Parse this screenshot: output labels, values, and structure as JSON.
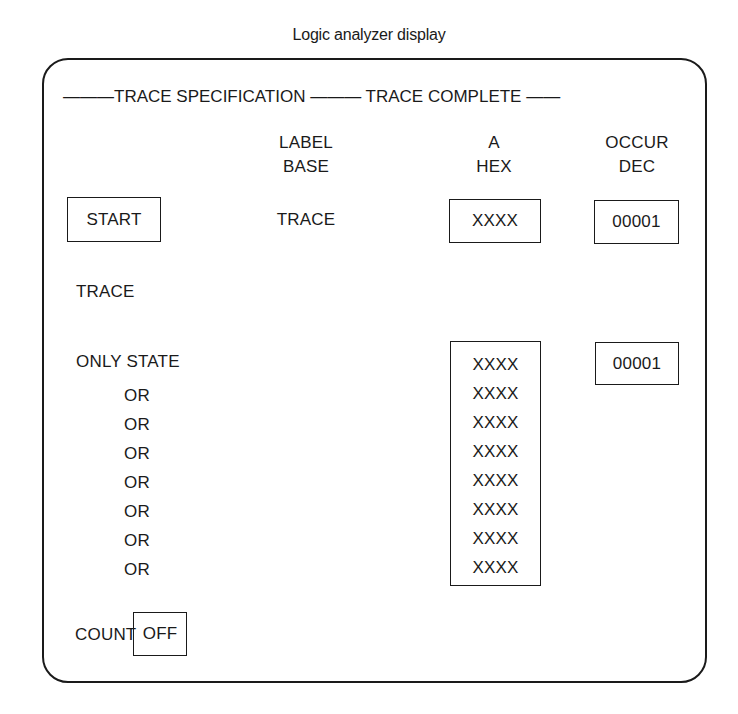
{
  "title": "Logic analyzer display",
  "header": {
    "left_dashes": "———",
    "section": "TRACE SPECIFICATION",
    "mid_dashes": "———",
    "status": "TRACE COMPLETE",
    "right_dashes": "——"
  },
  "columns": {
    "label": {
      "line1": "LABEL",
      "line2": "BASE"
    },
    "a": {
      "line1": "A",
      "line2": "HEX"
    },
    "occur": {
      "line1": "OCCUR",
      "line2": "DEC"
    }
  },
  "start_row": {
    "button": "START",
    "mode": "TRACE",
    "a_value": "XXXX",
    "occur_value": "00001"
  },
  "trace_label": "TRACE",
  "only_state": {
    "label": "ONLY STATE",
    "or_labels": [
      "OR",
      "OR",
      "OR",
      "OR",
      "OR",
      "OR",
      "OR"
    ],
    "a_values": [
      "XXXX",
      "XXXX",
      "XXXX",
      "XXXX",
      "XXXX",
      "XXXX",
      "XXXX",
      "XXXX"
    ],
    "occur_value": "00001"
  },
  "count": {
    "label": "COUNT",
    "value": "OFF"
  }
}
